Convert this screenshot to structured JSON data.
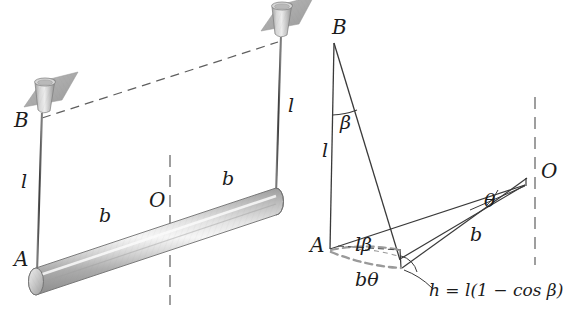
{
  "figure": {
    "background_color": "#ffffff",
    "ink_color": "#1b1b1b",
    "gray_color": "#9a9a9a",
    "metal_light": "#f2f2f2",
    "metal_mid": "#c9c9c9",
    "metal_dark": "#8e8e8e",
    "mount_plate_color": "#a8a8a8"
  },
  "left_diagram": {
    "name": "equilibrium-view",
    "labels": {
      "point_b": "B",
      "point_a": "A",
      "center_o": "O",
      "string_left_length": "l",
      "string_right_length": "l",
      "half_rod_left": "b",
      "half_rod_right": "b"
    },
    "elements": {
      "ceiling_mount_left": "ceiling-mount",
      "ceiling_mount_right": "ceiling-mount",
      "string_left": "suspension-string",
      "string_right": "suspension-string",
      "rod": "rigid-rod",
      "ceiling_dashed_line": "ceiling-reference-line",
      "vertical_axis": "vertical-rotation-axis"
    }
  },
  "right_diagram": {
    "name": "displaced-view",
    "labels": {
      "point_b": "B",
      "point_a": "A",
      "point_o": "O",
      "string_length": "l",
      "angle_beta": "β",
      "angle_theta": "θ",
      "arc_l_beta": "lβ",
      "arc_b_theta": "bθ",
      "half_rod": "b",
      "height_equation": "h = l(1 − cos β)"
    },
    "elements": {
      "string_vertical": "string-at-rest",
      "string_displaced": "string-displaced",
      "arc_l_beta": "arc-l-beta",
      "arc_b_theta": "arc-b-theta",
      "rod_displaced": "rod-displaced",
      "rod_reference": "rod-reference",
      "vertical_axis": "vertical-rotation-axis",
      "height_leader": "height-leader-line",
      "angle_arc_beta": "angle-arc-beta",
      "angle_arc_theta": "angle-arc-theta",
      "angle_arc_h": "angle-arc-h"
    }
  }
}
